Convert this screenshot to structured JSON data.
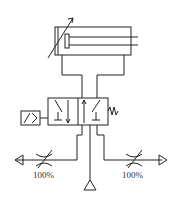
{
  "diagram": {
    "type": "pneumatic-circuit",
    "components": {
      "cylinder": {
        "kind": "double-acting cylinder with adjustable cushioning"
      },
      "valve": {
        "kind": "4/2 solenoid valve with spring return"
      },
      "flow_control_left": {
        "label": "100%"
      },
      "flow_control_right": {
        "label": "100%"
      },
      "supply": {
        "kind": "pressure source"
      },
      "exhaust_left": {
        "kind": "exhaust"
      },
      "exhaust_right": {
        "kind": "exhaust"
      }
    },
    "colors": {
      "line": "#222222",
      "background": "#ffffff"
    }
  }
}
